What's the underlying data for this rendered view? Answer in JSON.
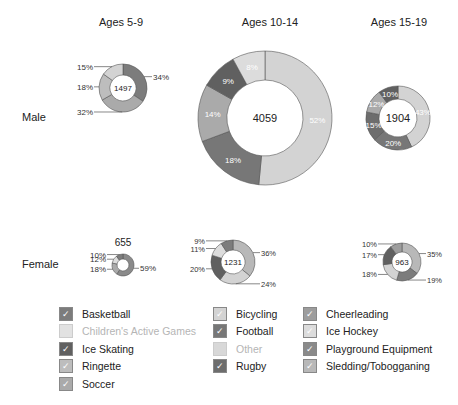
{
  "chart_data": {
    "type": "pie",
    "subtype": "donut-grid",
    "columns": [
      "Ages 5-9",
      "Ages 10-14",
      "Ages 15-19"
    ],
    "rows": [
      "Male",
      "Female"
    ],
    "donuts": [
      {
        "row": "Male",
        "column": "Ages 5-9",
        "total": 1497,
        "segments": [
          {
            "category": "Basketball",
            "pct": 34
          },
          {
            "category": "Soccer",
            "pct": 32
          },
          {
            "category": "Ringette",
            "pct": 18
          },
          {
            "category": "Bicycling",
            "pct": 15
          }
        ]
      },
      {
        "row": "Male",
        "column": "Ages 10-14",
        "total": 4059,
        "segments": [
          {
            "category": "Bicycling",
            "pct": 52
          },
          {
            "category": "Football",
            "pct": 18
          },
          {
            "category": "Soccer",
            "pct": 14
          },
          {
            "category": "Ice Skating",
            "pct": 9
          },
          {
            "category": "Ice Hockey",
            "pct": 8
          }
        ]
      },
      {
        "row": "Male",
        "column": "Ages 15-19",
        "total": 1904,
        "segments": [
          {
            "category": "Bicycling",
            "pct": 43
          },
          {
            "category": "Football",
            "pct": 20
          },
          {
            "category": "Rugby",
            "pct": 15
          },
          {
            "category": "Soccer",
            "pct": 12
          },
          {
            "category": "Ice Skating",
            "pct": 10
          }
        ]
      },
      {
        "row": "Female",
        "column": "Ages 5-9",
        "total": 655,
        "segments": [
          {
            "category": "Playground Equipment",
            "pct": 59
          },
          {
            "category": "Soccer",
            "pct": 18
          },
          {
            "category": "Ice Hockey",
            "pct": 12
          },
          {
            "category": "Basketball",
            "pct": 10
          }
        ]
      },
      {
        "row": "Female",
        "column": "Ages 10-14",
        "total": 1231,
        "segments": [
          {
            "category": "Sledding/Tobogganing",
            "pct": 36
          },
          {
            "category": "Bicycling",
            "pct": 24
          },
          {
            "category": "Ice Skating",
            "pct": 20
          },
          {
            "category": "Ice Hockey",
            "pct": 11
          },
          {
            "category": "Basketball",
            "pct": 9
          }
        ]
      },
      {
        "row": "Female",
        "column": "Ages 15-19",
        "total": 963,
        "segments": [
          {
            "category": "Sledding/Tobogganing",
            "pct": 35
          },
          {
            "category": "Basketball",
            "pct": 19
          },
          {
            "category": "Bicycling",
            "pct": 18
          },
          {
            "category": "Ice Skating",
            "pct": 17
          },
          {
            "category": "Cheerleading",
            "pct": 10
          }
        ]
      }
    ],
    "legend": [
      "Basketball",
      "Bicycling",
      "Cheerleading",
      "Children's Active Games",
      "Football",
      "Ice Hockey",
      "Ice Skating",
      "Other",
      "Playground Equipment",
      "Ringette",
      "Rugby",
      "Sledding/Tobogganing",
      "Soccer"
    ],
    "legend_disabled": [
      "Children's Active Games",
      "Other"
    ],
    "legend_position": "bottom"
  },
  "header": {
    "col1": "Ages 5-9",
    "col2": "Ages 10-14",
    "col3": "Ages 15-19"
  },
  "rows": {
    "male": "Male",
    "female": "Female"
  },
  "colors": {
    "Basketball": "#7c7c7c",
    "Bicycling": "#d3d3d3",
    "Cheerleading": "#9d9d9d",
    "Children's Active Games": "#e2e2e2",
    "Football": "#777777",
    "Ice Hockey": "#dcdcdc",
    "Ice Skating": "#606060",
    "Other": "#d8d8d8",
    "Playground Equipment": "#8a8a8a",
    "Ringette": "#bdbdbd",
    "Rugby": "#6d6d6d",
    "Sledding/Tobogganing": "#b8b8b8",
    "Soccer": "#aaaaaa"
  },
  "legend": {
    "items": [
      {
        "label": "Basketball",
        "check": "✓",
        "enabled": true
      },
      {
        "label": "Children's Active Games",
        "check": "",
        "enabled": false
      },
      {
        "label": "Ice Skating",
        "check": "✓",
        "enabled": true
      },
      {
        "label": "Ringette",
        "check": "✓",
        "enabled": true
      },
      {
        "label": "Soccer",
        "check": "✓",
        "enabled": true
      },
      {
        "label": "Bicycling",
        "check": "✓",
        "enabled": true
      },
      {
        "label": "Football",
        "check": "✓",
        "enabled": true
      },
      {
        "label": "Other",
        "check": "",
        "enabled": false
      },
      {
        "label": "Rugby",
        "check": "✓",
        "enabled": true
      },
      {
        "label": "Cheerleading",
        "check": "✓",
        "enabled": true
      },
      {
        "label": "Ice Hockey",
        "check": "✓",
        "enabled": true
      },
      {
        "label": "Playground Equipment",
        "check": "✓",
        "enabled": true
      },
      {
        "label": "Sledding/Tobogganing",
        "check": "✓",
        "enabled": true
      }
    ]
  }
}
